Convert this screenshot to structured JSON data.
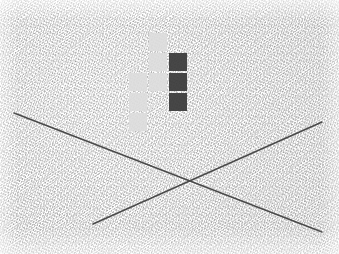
{
  "scene": {
    "title": "Textured wall photo with overlaid grid squares and crossing lines",
    "width": 339,
    "height": 254,
    "background_description": "rough light gray stucco / textured paper surface",
    "background_color": "#f2f2f2"
  },
  "palette": {
    "light_square": "#dcdcdc",
    "dark_square": "#3b3b3b",
    "line_color": "#4a4a4a",
    "surface": "#f2f2f2"
  },
  "grid": {
    "label": "overlay-square-grid",
    "cell_size": 18,
    "gap": 2,
    "origin_x": 129,
    "origin_y": 33,
    "columns": 3,
    "rows": 5,
    "squares": [
      {
        "name": "square-r1c2",
        "row": 1,
        "col": 2,
        "x": 149,
        "y": 33,
        "shade": "light"
      },
      {
        "name": "square-r2c2",
        "row": 2,
        "col": 2,
        "x": 149,
        "y": 53,
        "shade": "light"
      },
      {
        "name": "square-r2c3",
        "row": 2,
        "col": 3,
        "x": 169,
        "y": 53,
        "shade": "dark"
      },
      {
        "name": "square-r3c1",
        "row": 3,
        "col": 1,
        "x": 129,
        "y": 73,
        "shade": "light"
      },
      {
        "name": "square-r3c2",
        "row": 3,
        "col": 2,
        "x": 149,
        "y": 73,
        "shade": "light"
      },
      {
        "name": "square-r3c3",
        "row": 3,
        "col": 3,
        "x": 169,
        "y": 73,
        "shade": "dark"
      },
      {
        "name": "square-r4c1",
        "row": 4,
        "col": 1,
        "x": 129,
        "y": 93,
        "shade": "light"
      },
      {
        "name": "square-r4c3",
        "row": 4,
        "col": 3,
        "x": 169,
        "y": 93,
        "shade": "dark"
      },
      {
        "name": "square-r5c1",
        "row": 5,
        "col": 1,
        "x": 129,
        "y": 113,
        "shade": "light"
      }
    ]
  },
  "lines": [
    {
      "name": "line-descending",
      "description": "diagonal line from upper-left to lower-right",
      "x1": 14,
      "y1": 113,
      "x2": 322,
      "y2": 232
    },
    {
      "name": "line-ascending",
      "description": "diagonal line from lower-left to upper-right",
      "x1": 93,
      "y1": 224,
      "x2": 322,
      "y2": 122
    }
  ],
  "intersection": {
    "name": "lines-crossing-point",
    "x": 186,
    "y": 180
  }
}
